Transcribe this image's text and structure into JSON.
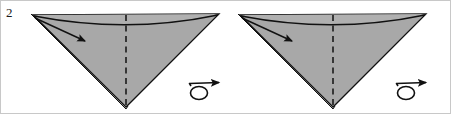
{
  "figure": {
    "kind": "origami-fold-diagram",
    "step_label": "2",
    "width": 451,
    "height": 114,
    "background_color": "#ffffff",
    "border_color": "#c8c8c8",
    "paper_fill": "#a8a8a8",
    "paper_fill_light": "#b4b4b4",
    "line_color": "#111111",
    "fold_layer_color": "#ffffff",
    "panels": [
      {
        "id": "panel-left",
        "name": "before-fold",
        "offset_x": 0,
        "shape": "inverted-triangle",
        "apex_left": [
          32,
          14
        ],
        "apex_right": [
          218,
          13
        ],
        "apex_bottom": [
          125,
          106
        ],
        "crease_dashed_x": 125,
        "crease_dashed_top_y": 14,
        "crease_dashed_bottom_y": 104,
        "arc_sag_y": 25,
        "arrow_from": [
          34,
          17
        ],
        "arrow_to": [
          88,
          42
        ],
        "turnover_symbol": {
          "cx": 198,
          "cy": 88,
          "label": "turn-over"
        }
      },
      {
        "id": "panel-right",
        "name": "after-fold",
        "offset_x": 207,
        "shape": "inverted-triangle",
        "apex_left": [
          32,
          14
        ],
        "apex_right": [
          218,
          13
        ],
        "apex_bottom": [
          125,
          106
        ],
        "crease_dashed_x": 125,
        "crease_dashed_top_y": 14,
        "crease_dashed_bottom_y": 104,
        "arc_sag_y": 25,
        "arrow_from": [
          34,
          17
        ],
        "arrow_to": [
          88,
          42
        ],
        "turnover_symbol": {
          "cx": 198,
          "cy": 88,
          "label": "turn-over"
        }
      }
    ],
    "legend": {
      "dashed_line_meaning": "valley-fold-crease",
      "solid_arrow_meaning": "fold-direction",
      "loop_arrow_meaning": "turn-model-over"
    }
  }
}
